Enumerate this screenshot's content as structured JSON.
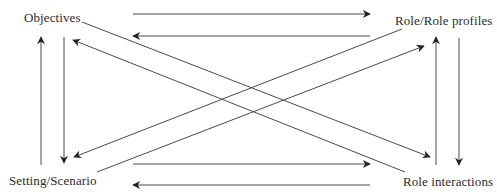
{
  "diagram": {
    "type": "bidirectional-relationship-diagram",
    "nodes": [
      {
        "id": "objectives",
        "label": "Objectives",
        "position": "top-left"
      },
      {
        "id": "role_profiles",
        "label": "Role/Role profiles",
        "position": "top-right"
      },
      {
        "id": "setting_scenario",
        "label": "Setting/Scenario",
        "position": "bottom-left"
      },
      {
        "id": "role_interactions",
        "label": "Role interactions",
        "position": "bottom-right"
      }
    ],
    "edges": [
      {
        "from": "objectives",
        "to": "role_profiles",
        "x1": 133,
        "y1": 14,
        "x2": 370,
        "y2": 14
      },
      {
        "from": "role_profiles",
        "to": "objectives",
        "x1": 370,
        "y1": 36,
        "x2": 133,
        "y2": 36
      },
      {
        "from": "setting_scenario",
        "to": "role_interactions",
        "x1": 133,
        "y1": 164,
        "x2": 370,
        "y2": 164
      },
      {
        "from": "role_interactions",
        "to": "setting_scenario",
        "x1": 370,
        "y1": 185,
        "x2": 133,
        "y2": 185
      },
      {
        "from": "setting_scenario",
        "to": "objectives",
        "x1": 41,
        "y1": 165,
        "x2": 41,
        "y2": 37
      },
      {
        "from": "objectives",
        "to": "setting_scenario",
        "x1": 64,
        "y1": 37,
        "x2": 64,
        "y2": 163
      },
      {
        "from": "role_interactions",
        "to": "role_profiles",
        "x1": 436,
        "y1": 165,
        "x2": 436,
        "y2": 37
      },
      {
        "from": "role_profiles",
        "to": "role_interactions",
        "x1": 459,
        "y1": 38,
        "x2": 459,
        "y2": 165
      },
      {
        "from": "objectives",
        "to": "role_interactions",
        "x1": 82,
        "y1": 22,
        "x2": 430,
        "y2": 157
      },
      {
        "from": "role_interactions",
        "to": "objectives",
        "x1": 405,
        "y1": 172,
        "x2": 73,
        "y2": 40
      },
      {
        "from": "role_profiles",
        "to": "setting_scenario",
        "x1": 402,
        "y1": 29,
        "x2": 74,
        "y2": 157
      },
      {
        "from": "setting_scenario",
        "to": "role_profiles",
        "x1": 97,
        "y1": 172,
        "x2": 424,
        "y2": 46
      }
    ]
  },
  "colors": {
    "line": "#4a4a4a",
    "text": "#2b2b2b",
    "background": "#ffffff"
  }
}
